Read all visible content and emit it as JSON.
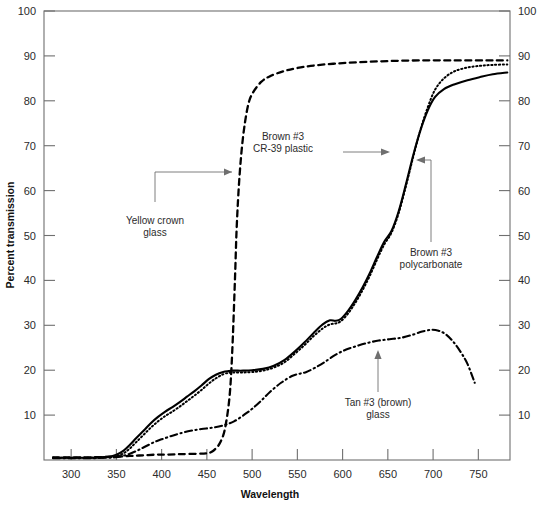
{
  "chart_data": {
    "type": "line",
    "title": "",
    "xlabel": "Wavelength",
    "ylabel": "Percent transmission",
    "xlim": [
      270,
      785
    ],
    "ylim": [
      0,
      100
    ],
    "grid": false,
    "legend_position": "inline-annotations",
    "xticks": [
      300,
      350,
      400,
      450,
      500,
      550,
      600,
      650,
      700,
      750
    ],
    "yticks": [
      0,
      10,
      20,
      30,
      40,
      50,
      60,
      70,
      80,
      90,
      100
    ],
    "y_axis_right_duplicate": true,
    "xtick_labels": [
      "300",
      "350",
      "400",
      "450",
      "500",
      "550",
      "600",
      "650",
      "700",
      "750"
    ],
    "ytick_labels": [
      "10",
      "20",
      "30",
      "40",
      "50",
      "60",
      "70",
      "80",
      "90",
      "100"
    ],
    "ytick_labels_right": [
      "10",
      "20",
      "30",
      "40",
      "50",
      "60",
      "70",
      "80",
      "90",
      "100"
    ],
    "series": [
      {
        "name": "Yellow crown glass",
        "style": "dashed",
        "x": [
          280,
          300,
          320,
          340,
          355,
          365,
          375,
          385,
          395,
          405,
          420,
          440,
          450,
          455,
          460,
          465,
          470,
          475,
          478,
          481,
          483,
          486,
          490,
          495,
          500,
          510,
          520,
          535,
          550,
          570,
          600,
          630,
          660,
          690,
          720,
          750,
          770,
          782
        ],
        "y": [
          0.6,
          0.6,
          0.6,
          0.7,
          0.8,
          0.9,
          1.0,
          1.1,
          1.2,
          1.2,
          1.3,
          1.4,
          1.5,
          1.8,
          2.6,
          4.0,
          7.0,
          14.0,
          24.0,
          40.0,
          52.0,
          63.0,
          72.0,
          78.5,
          81.5,
          84.2,
          85.5,
          86.6,
          87.3,
          87.9,
          88.4,
          88.7,
          88.9,
          89.0,
          89.0,
          89.0,
          89.0,
          89.0
        ]
      },
      {
        "name": "Brown #3 CR-39 plastic",
        "style": "dotted",
        "x": [
          280,
          300,
          320,
          340,
          350,
          358,
          365,
          372,
          380,
          388,
          396,
          404,
          412,
          420,
          428,
          436,
          444,
          452,
          460,
          468,
          474,
          478,
          482,
          490,
          500,
          512,
          524,
          536,
          548,
          558,
          568,
          578,
          586,
          592,
          598,
          606,
          614,
          622,
          630,
          638,
          646,
          654,
          662,
          670,
          678,
          686,
          694,
          702,
          712,
          724,
          738,
          752,
          766,
          782
        ],
        "y": [
          0.5,
          0.5,
          0.5,
          0.6,
          0.9,
          1.5,
          2.6,
          4.0,
          5.6,
          7.2,
          8.6,
          9.8,
          10.8,
          11.9,
          13.1,
          14.3,
          15.6,
          17.0,
          18.2,
          19.1,
          19.4,
          19.5,
          19.5,
          19.5,
          19.6,
          19.9,
          20.6,
          21.8,
          23.8,
          25.6,
          27.6,
          29.3,
          30.2,
          30.4,
          30.9,
          32.6,
          35.0,
          37.8,
          41.0,
          44.6,
          48.0,
          50.6,
          55.0,
          61.0,
          67.5,
          73.5,
          78.5,
          82.4,
          85.0,
          86.6,
          87.4,
          87.8,
          88.0,
          88.1
        ]
      },
      {
        "name": "Brown #3 polycarbonate",
        "style": "solid",
        "x": [
          280,
          300,
          320,
          340,
          350,
          358,
          365,
          372,
          380,
          388,
          396,
          404,
          412,
          420,
          428,
          436,
          444,
          452,
          460,
          468,
          474,
          478,
          482,
          490,
          500,
          512,
          524,
          536,
          548,
          558,
          568,
          578,
          586,
          592,
          598,
          606,
          614,
          622,
          630,
          638,
          646,
          654,
          662,
          670,
          678,
          686,
          694,
          702,
          712,
          724,
          738,
          752,
          766,
          782
        ],
        "y": [
          0.5,
          0.5,
          0.5,
          0.7,
          1.2,
          2.1,
          3.4,
          4.9,
          6.5,
          8.2,
          9.6,
          10.8,
          11.8,
          12.9,
          14.1,
          15.3,
          16.6,
          18.0,
          19.0,
          19.6,
          19.8,
          19.9,
          19.9,
          19.9,
          20.0,
          20.3,
          21.0,
          22.3,
          24.3,
          26.2,
          28.3,
          30.2,
          31.1,
          31.0,
          31.4,
          33.2,
          35.6,
          38.4,
          41.6,
          45.2,
          48.6,
          51.0,
          55.4,
          61.4,
          67.8,
          73.4,
          77.8,
          80.8,
          82.6,
          83.7,
          84.6,
          85.3,
          85.9,
          86.3
        ]
      },
      {
        "name": "Tan #3 (brown) glass",
        "style": "dash-dot",
        "x": [
          280,
          300,
          320,
          340,
          352,
          362,
          372,
          382,
          392,
          400,
          410,
          420,
          432,
          444,
          456,
          468,
          480,
          492,
          500,
          510,
          520,
          532,
          544,
          552,
          560,
          570,
          580,
          592,
          604,
          616,
          628,
          640,
          652,
          664,
          676,
          688,
          698,
          706,
          714,
          722,
          730,
          738,
          746
        ],
        "y": [
          0.4,
          0.4,
          0.4,
          0.5,
          0.7,
          1.2,
          2.0,
          3.0,
          4.0,
          4.6,
          5.3,
          5.9,
          6.5,
          6.9,
          7.2,
          7.7,
          8.6,
          10.2,
          11.4,
          13.2,
          15.2,
          17.2,
          18.7,
          19.2,
          19.6,
          20.6,
          21.8,
          23.4,
          24.6,
          25.4,
          26.1,
          26.6,
          26.9,
          27.2,
          27.8,
          28.6,
          29.0,
          28.8,
          28.0,
          26.4,
          24.2,
          21.4,
          17.2
        ]
      }
    ],
    "annotations": [
      {
        "id": "yellow-crown-glass",
        "text_line1": "Yellow crown",
        "text_line2": "glass",
        "points_to": "Yellow crown glass curve"
      },
      {
        "id": "brown-3-cr39-plastic",
        "text_line1": "Brown #3",
        "text_line2": "CR-39 plastic",
        "points_to": "Brown #3 CR-39 plastic curve"
      },
      {
        "id": "brown-3-polycarbonate",
        "text_line1": "Brown #3",
        "text_line2": "polycarbonate",
        "points_to": "Brown #3 polycarbonate curve"
      },
      {
        "id": "tan-3-brown-glass",
        "text_line1": "Tan #3 (brown)",
        "text_line2": "glass",
        "points_to": "Tan #3 (brown) glass curve"
      }
    ]
  },
  "colors": {
    "curve": "#000000",
    "axis": "#6f6f6f",
    "text": "#2b2b2b",
    "background": "#ffffff"
  }
}
